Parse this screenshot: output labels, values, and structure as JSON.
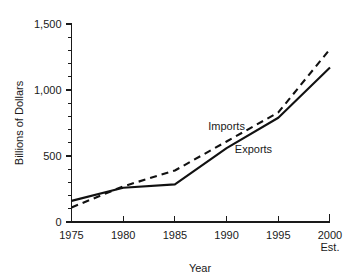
{
  "chart_data": {
    "type": "line",
    "title": "",
    "xlabel": "Year",
    "ylabel": "Billions of Dollars",
    "x": [
      1975,
      1980,
      1985,
      1990,
      1995,
      2000
    ],
    "xtick_labels": [
      "1975",
      "1980",
      "1985",
      "1990",
      "1995",
      "2000"
    ],
    "xtick_sublabel_last": "Est.",
    "xlim": [
      1975,
      2000
    ],
    "ylim": [
      0,
      1500
    ],
    "ytick_labels": [
      "0",
      "500",
      "1,000",
      "1,500"
    ],
    "ytick_values": [
      0,
      500,
      1000,
      1500
    ],
    "yminor_step": 100,
    "grid": false,
    "legend_position": "inline-annotation",
    "series": [
      {
        "name": "Imports",
        "style": "dashed",
        "color": "#111111",
        "values": [
          110,
          270,
          390,
          610,
          830,
          1310
        ]
      },
      {
        "name": "Exports",
        "style": "solid",
        "color": "#111111",
        "values": [
          160,
          260,
          285,
          560,
          790,
          1170
        ]
      }
    ],
    "annotations": [
      {
        "text": "Imports",
        "x": 1990.0,
        "y": 700
      },
      {
        "text": "Exports",
        "x": 1992.6,
        "y": 520
      }
    ]
  },
  "colors": {
    "ink": "#1a1a1a",
    "line": "#111111",
    "background": "#ffffff"
  }
}
